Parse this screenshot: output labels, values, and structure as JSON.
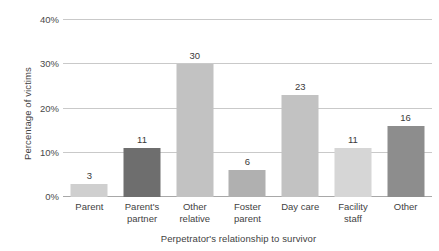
{
  "chart_data": {
    "type": "bar",
    "title": "",
    "subtitle": "",
    "xlabel": "Perpetrator's relationship to survivor",
    "ylabel": "Percentage of victims",
    "categories": [
      "Parent",
      "Parent's partner",
      "Other relative",
      "Foster parent",
      "Day care",
      "Facility staff",
      "Other"
    ],
    "category_lines": [
      [
        "Parent"
      ],
      [
        "Parent's",
        "partner"
      ],
      [
        "Other",
        "relative"
      ],
      [
        "Foster",
        "parent"
      ],
      [
        "Day care"
      ],
      [
        "Facility",
        "staff"
      ],
      [
        "Other"
      ]
    ],
    "values": [
      3,
      11,
      30,
      6,
      23,
      11,
      16
    ],
    "value_labels": [
      "3",
      "11",
      "30",
      "6",
      "23",
      "11",
      "16"
    ],
    "bar_colors": [
      "#cfcfcf",
      "#6e6e6e",
      "#c2c2c2",
      "#b0b0b0",
      "#c2c2c2",
      "#d6d6d6",
      "#8d8d8d"
    ],
    "ylim": [
      0,
      40
    ],
    "ytick_values": [
      40,
      30,
      20,
      10,
      0
    ],
    "ytick_labels": [
      "40%",
      "30%",
      "20%",
      "10%",
      "0%"
    ],
    "grid": true,
    "gridline_color": "#c9c9c9",
    "baseline_color": "#a8a8a8",
    "legend": false,
    "legend_position": "none",
    "background_color": "#ffffff",
    "text_color": "#3f3f3f"
  }
}
